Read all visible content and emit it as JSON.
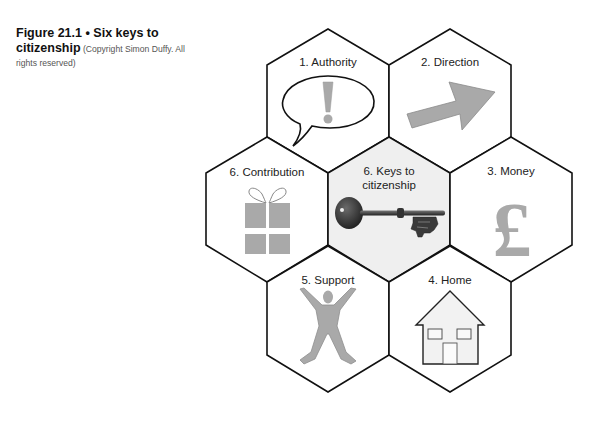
{
  "figure": {
    "number_title": "Figure 21.1 • Six keys to",
    "title_line2": "citizenship",
    "credit": "(Copyright Simon Duffy. All rights reserved)"
  },
  "hexagons": [
    {
      "id": "authority",
      "label": "1.  Authority",
      "icon": "speech-bubble-exclamation-icon",
      "center": [
        328,
        101
      ]
    },
    {
      "id": "direction",
      "label": "2.  Direction",
      "icon": "arrow-up-right-icon",
      "center": [
        450,
        101
      ]
    },
    {
      "id": "money",
      "label": "3.  Money",
      "icon": "pound-sign-icon",
      "glyph": "£",
      "center": [
        511,
        209
      ]
    },
    {
      "id": "home",
      "label": "4.  Home",
      "icon": "house-icon",
      "center": [
        450,
        319
      ]
    },
    {
      "id": "support",
      "label": "5.  Support",
      "icon": "person-arms-raised-icon",
      "center": [
        328,
        319
      ]
    },
    {
      "id": "contribution",
      "label": "6.  Contribution",
      "icon": "gift-icon",
      "center": [
        267,
        209
      ]
    },
    {
      "id": "keys",
      "label_line1": "6.  Keys to",
      "label_line2": "citizenship",
      "icon": "key-icon",
      "center": [
        389,
        209
      ],
      "highlighted": true
    }
  ],
  "colors": {
    "stroke": "#111111",
    "center_fill": "#efefef",
    "icon_gray": "#a9a9a9",
    "key_dark": "#2b2b2b"
  }
}
